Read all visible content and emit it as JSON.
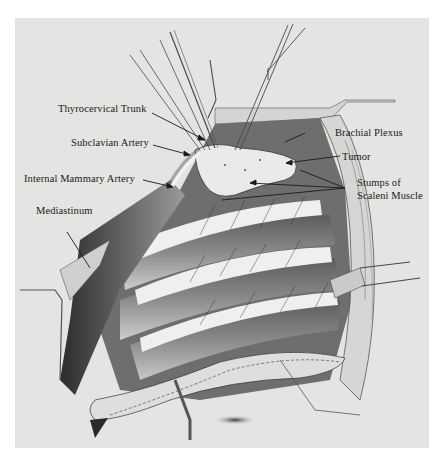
{
  "figure": {
    "type": "anatomical-illustration",
    "colors": {
      "background": "#ffffff",
      "panel": "#e4e4e2",
      "ink": "#1a1a1a",
      "shade_dark": "#2a2a2a",
      "shade_mid": "#8c8c8a",
      "tissue_light": "#f2f2f0"
    }
  },
  "labels": [
    {
      "id": "thyrocervical-trunk",
      "text": "Thyrocervical Trunk",
      "side": "left"
    },
    {
      "id": "subclavian-artery",
      "text": "Subclavian Artery",
      "side": "left"
    },
    {
      "id": "internal-mammary-artery",
      "text": "Internal Mammary Artery",
      "side": "left"
    },
    {
      "id": "mediastinum",
      "text": "Mediastinum",
      "side": "left"
    },
    {
      "id": "brachial-plexus",
      "text": "Brachial Plexus",
      "side": "right"
    },
    {
      "id": "tumor",
      "text": "Tumor",
      "side": "right"
    },
    {
      "id": "stumps-scaleni-1",
      "text": "Stumps of",
      "side": "right"
    },
    {
      "id": "stumps-scaleni-2",
      "text": "Scaleni Muscle",
      "side": "right"
    }
  ]
}
